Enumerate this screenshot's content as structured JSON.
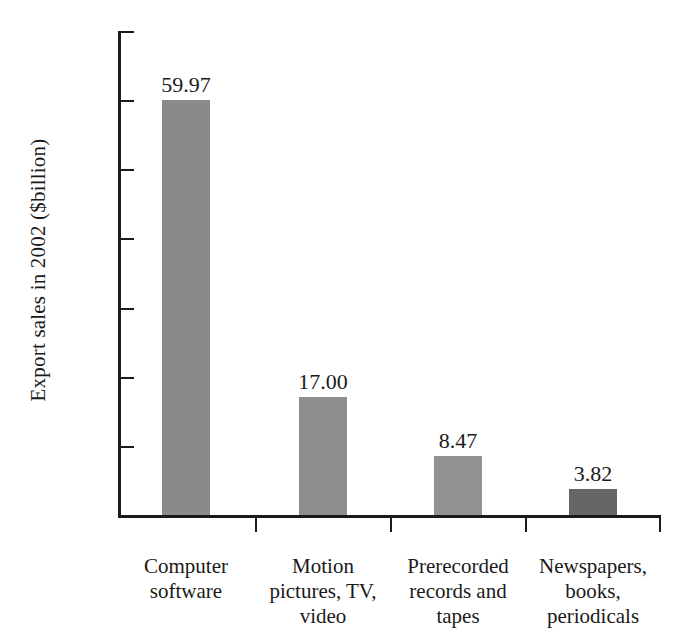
{
  "chart_data": {
    "type": "bar",
    "title": "",
    "subtitle": "",
    "xlabel": "",
    "ylabel": "Export sales in 2002 ($billion)",
    "categories": [
      "Computer\nsoftware",
      "Motion\npictures, TV,\nvideo",
      "Prerecorded\nrecords and\ntapes",
      "Newspapers,\nbooks,\nperiodicals"
    ],
    "values": [
      59.97,
      17.0,
      8.47,
      3.82
    ],
    "value_labels": [
      "59.97",
      "17.00",
      "8.47",
      "3.82"
    ],
    "bar_colors": [
      "#8a8a8a",
      "#8d8d8d",
      "#919191",
      "#666666"
    ],
    "ylim": [
      0,
      70
    ],
    "ytick_values": [
      70,
      60,
      50,
      40,
      30,
      20,
      10
    ],
    "ytick_labels": [
      "$70",
      "60",
      "50",
      "40",
      "30",
      "20",
      "10"
    ],
    "grid": false,
    "legend": null,
    "axis_color": "#1a1a1a",
    "background": "#ffffff"
  }
}
